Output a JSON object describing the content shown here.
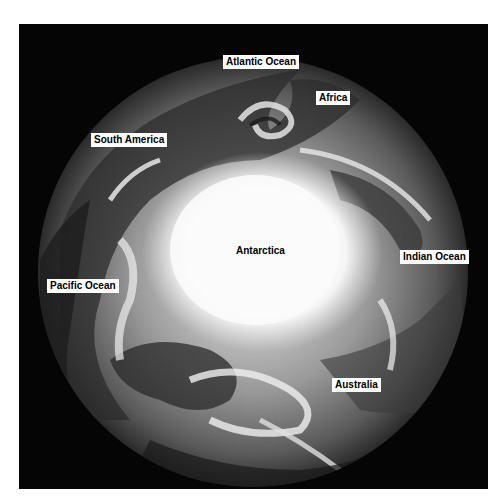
{
  "image": {
    "description": "Satellite view of Earth centered on the South Pole",
    "background_color": "#050505",
    "colors": {
      "ice": "#f7f7f7",
      "cloud": "#d8d8d8",
      "ocean": "#2a2a2a",
      "land": "#4a4a4a"
    }
  },
  "labels": {
    "atlantic_ocean": "Atlantic Ocean",
    "africa": "Africa",
    "south_america": "South America",
    "antarctica": "Antarctica",
    "indian_ocean": "Indian Ocean",
    "pacific_ocean": "Pacific Ocean",
    "australia": "Australia"
  }
}
